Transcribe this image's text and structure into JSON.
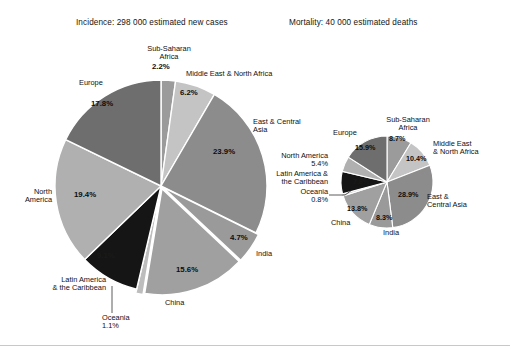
{
  "chart_data": [
    {
      "type": "pie",
      "title": "Incidence: 298 000 estimated new cases",
      "id": "incidence",
      "categories": [
        "Sub-Saharan Africa",
        "Middle East & North Africa",
        "East & Central Asia",
        "India",
        "China",
        "Oceania",
        "Latin America & the Caribbean",
        "North America",
        "Europe"
      ],
      "values": [
        2.2,
        6.2,
        23.9,
        4.7,
        15.6,
        1.1,
        9.1,
        19.4,
        17.8
      ],
      "unit": "%",
      "labels": [
        "2.2%",
        "6.2%",
        "23.9%",
        "4.7%",
        "15.6%",
        "1.1%",
        "9.1%",
        "19.4%",
        "17.8%"
      ],
      "colors": [
        "#9b9b9b",
        "#c4c4c4",
        "#8c8c8c",
        "#9a9a9a",
        "#a0a0a0",
        "#bdbdbd",
        "#151515",
        "#b0b0b0",
        "#6e6e6e"
      ],
      "legend": "labels-outside",
      "grid": false
    },
    {
      "type": "pie",
      "title": "Mortality: 40 000 estimated deaths",
      "id": "mortality",
      "categories": [
        "Sub-Saharan Africa",
        "Middle East & North Africa",
        "East & Central Asia",
        "India",
        "China",
        "Oceania",
        "Latin America & the Caribbean",
        "North America",
        "Europe"
      ],
      "values": [
        8.7,
        10.4,
        28.9,
        8.3,
        13.8,
        0.8,
        7.8,
        5.4,
        15.9
      ],
      "unit": "%",
      "labels": [
        "8.7%",
        "10.4%",
        "28.9%",
        "8.3%",
        "13.8%",
        "0.8%",
        "7.8%",
        "5.4%",
        "15.9%"
      ],
      "colors": [
        "#9b9b9b",
        "#c4c4c4",
        "#8c8c8c",
        "#9a9a9a",
        "#a0a0a0",
        "#bdbdbd",
        "#151515",
        "#b0b0b0",
        "#6e6e6e"
      ],
      "legend": "labels-outside",
      "grid": false
    }
  ],
  "incidence": {
    "title": "Incidence: 298 000 estimated new cases",
    "labels": {
      "subsaharan": "Sub-Saharan\nAfrica",
      "subsaharan_pct": "2.2%",
      "mena": "Middle East & North Africa",
      "mena_pct": "6.2%",
      "eca": "East & Central\nAsia",
      "eca_pct": "23.9%",
      "india": "India",
      "india_pct": "4.7%",
      "china": "China",
      "china_pct": "15.6%",
      "oceania": "Oceania\n1.1%",
      "latam": "Latin America\n& the Caribbean",
      "latam_pct": "9.1%",
      "northamerica": "North\nAmerica",
      "northamerica_pct": "19.4%",
      "europe": "Europe",
      "europe_pct": "17.8%"
    }
  },
  "mortality": {
    "title": "Mortality: 40 000 estimated deaths",
    "labels": {
      "subsaharan": "Sub-Saharan\nAfrica",
      "subsaharan_pct": "8.7%",
      "mena": "Middle East\n& North Africa",
      "mena_pct": "10.4%",
      "eca": "East &\nCentral Asia",
      "eca_pct": "28.9%",
      "india": "India",
      "india_pct": "8.3%",
      "china": "China",
      "china_pct": "13.8%",
      "oceania": "Oceania\n0.8%",
      "latam": "Latin America &\nthe Caribbean",
      "latam_pct": "7.8%",
      "northamerica": "North America\n5.4%",
      "europe": "Europe",
      "europe_pct": "15.9%"
    }
  }
}
